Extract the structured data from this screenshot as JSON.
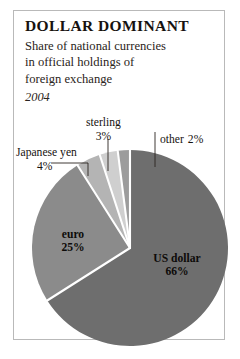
{
  "chart_data": {
    "type": "pie",
    "title": "DOLLAR DOMINANT",
    "subtitle": "Share of national currencies in official holdings of foreign exchange",
    "period": "2004",
    "xlabel": "",
    "ylabel": "",
    "legend_position": "none",
    "grid": false,
    "units": "percent",
    "categories": [
      "US dollar",
      "euro",
      "Japanese yen",
      "sterling",
      "other"
    ],
    "values": [
      66,
      25,
      4,
      3,
      2
    ],
    "colors": [
      "#6e6e6e",
      "#8b8b8b",
      "#b4b4b4",
      "#cfcfcf",
      "#9c9c9c"
    ],
    "slices": [
      {
        "label": "US dollar",
        "value": 66,
        "value_text": "66%",
        "color": "#6e6e6e",
        "label_placement": "inside"
      },
      {
        "label": "euro",
        "value": 25,
        "value_text": "25%",
        "color": "#8b8b8b",
        "label_placement": "inside"
      },
      {
        "label": "Japanese yen",
        "value": 4,
        "value_text": "4%",
        "color": "#b4b4b4",
        "label_placement": "callout"
      },
      {
        "label": "sterling",
        "value": 3,
        "value_text": "3%",
        "color": "#cfcfcf",
        "label_placement": "callout"
      },
      {
        "label": "other",
        "value": 2,
        "value_text": "2%",
        "color": "#9c9c9c",
        "label_placement": "callout"
      }
    ]
  },
  "header": {
    "title": "DOLLAR DOMINANT",
    "subtitle_line1": "Share of national currencies",
    "subtitle_line2": "in official holdings of",
    "subtitle_line3": "foreign exchange",
    "period": "2004"
  },
  "labels": {
    "japanese_yen": {
      "name": "Japanese yen",
      "pct": "4%"
    },
    "sterling": {
      "name": "sterling",
      "pct": "3%"
    },
    "other": {
      "name": "other",
      "pct": "2%"
    },
    "euro": {
      "name": "euro",
      "pct": "25%"
    },
    "us_dollar": {
      "name": "US dollar",
      "pct": "66%"
    }
  }
}
